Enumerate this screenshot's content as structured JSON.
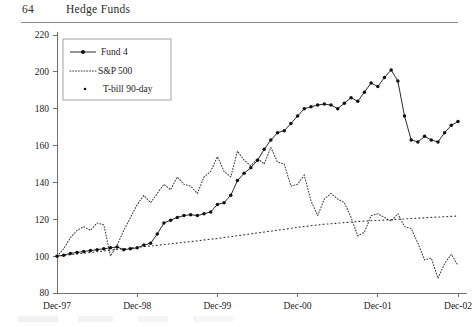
{
  "page": {
    "folio": "64",
    "running_title": "Hedge Funds"
  },
  "chart_data": {
    "type": "line",
    "title": "",
    "xlabel": "",
    "ylabel": "",
    "ylim": [
      80,
      220
    ],
    "yticks": [
      80,
      100,
      120,
      140,
      160,
      180,
      200,
      220
    ],
    "xticks": [
      "Dec-97",
      "Dec-98",
      "Dec-99",
      "Dec-00",
      "Dec-01",
      "Dec-02"
    ],
    "grid": false,
    "legend_position": "top-left",
    "x": [
      "Dec-97",
      "Jan-98",
      "Feb-98",
      "Mar-98",
      "Apr-98",
      "May-98",
      "Jun-98",
      "Jul-98",
      "Aug-98",
      "Sep-98",
      "Oct-98",
      "Nov-98",
      "Dec-98",
      "Jan-99",
      "Feb-99",
      "Mar-99",
      "Apr-99",
      "May-99",
      "Jun-99",
      "Jul-99",
      "Aug-99",
      "Sep-99",
      "Oct-99",
      "Nov-99",
      "Dec-99",
      "Jan-00",
      "Feb-00",
      "Mar-00",
      "Apr-00",
      "May-00",
      "Jun-00",
      "Jul-00",
      "Aug-00",
      "Sep-00",
      "Oct-00",
      "Nov-00",
      "Dec-00",
      "Jan-01",
      "Feb-01",
      "Mar-01",
      "Apr-01",
      "May-01",
      "Jun-01",
      "Jul-01",
      "Aug-01",
      "Sep-01",
      "Oct-01",
      "Nov-01",
      "Dec-01",
      "Jan-02",
      "Feb-02",
      "Mar-02",
      "Apr-02",
      "May-02",
      "Jun-02",
      "Jul-02",
      "Aug-02",
      "Sep-02",
      "Oct-02",
      "Nov-02",
      "Dec-02"
    ],
    "series": [
      {
        "name": "Fund 4",
        "style": "solid-marker",
        "values": [
          100,
          100.5,
          101.5,
          102,
          102.5,
          103,
          103.5,
          104,
          104.5,
          105,
          103.5,
          104,
          104.5,
          106,
          107,
          112,
          118,
          119.5,
          121,
          122,
          122.5,
          122,
          123,
          124,
          128,
          129,
          133,
          141,
          145,
          148,
          152,
          158,
          163,
          167,
          168,
          172,
          176,
          180,
          181,
          182,
          182.5,
          182,
          180,
          183,
          186,
          184,
          189,
          194,
          192,
          197,
          201,
          195,
          176,
          163,
          162,
          165,
          163,
          162,
          167,
          171,
          173
        ]
      },
      {
        "name": "S&P 500",
        "style": "dotted",
        "values": [
          100,
          104,
          110,
          114,
          116,
          114,
          118,
          117,
          100,
          106,
          114,
          121,
          128,
          133,
          129,
          134,
          139,
          136,
          143,
          139,
          138,
          134,
          143,
          146,
          154,
          146,
          143,
          157,
          152,
          149,
          153,
          150,
          159,
          151,
          150,
          138,
          139,
          144,
          130,
          122,
          131,
          134,
          131,
          129,
          121,
          111,
          113,
          122,
          123,
          121,
          119,
          123,
          116,
          115,
          107,
          98,
          99,
          88,
          96,
          101,
          95
        ]
      },
      {
        "name": "T-bill 90-day",
        "style": "dotted-sparse",
        "values": [
          100,
          100.4,
          100.8,
          101.2,
          101.6,
          102.0,
          102.4,
          102.8,
          103.2,
          103.6,
          104.0,
          104.4,
          104.8,
          105.2,
          105.5,
          105.9,
          106.3,
          106.7,
          107.1,
          107.5,
          107.9,
          108.3,
          108.8,
          109.2,
          109.6,
          110.1,
          110.6,
          111.1,
          111.6,
          112.1,
          112.6,
          113.1,
          113.6,
          114.1,
          114.6,
          115.1,
          115.6,
          116.1,
          116.5,
          116.9,
          117.3,
          117.6,
          117.9,
          118.2,
          118.5,
          118.8,
          119.0,
          119.2,
          119.4,
          119.6,
          119.8,
          120.0,
          120.2,
          120.4,
          120.6,
          120.8,
          121.0,
          121.2,
          121.4,
          121.6,
          121.8
        ]
      }
    ]
  },
  "legend": {
    "entries": [
      {
        "label": "Fund 4"
      },
      {
        "label": "S&P 500"
      },
      {
        "label": "T-bill 90-day"
      }
    ]
  }
}
